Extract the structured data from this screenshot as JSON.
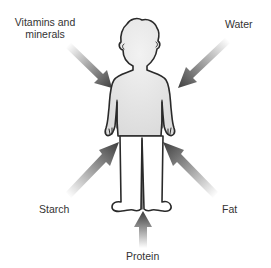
{
  "diagram": {
    "type": "nutrient-intake-figure",
    "central_figure": "human-body",
    "colors": {
      "outline": "#2a2a2a",
      "body_fill": "#e6e6e6",
      "arrow_dark": "#4a4a4a",
      "arrow_light": "#ffffff",
      "label_text": "#333333"
    },
    "labels": {
      "vitamins_line1": "Vitamins and",
      "vitamins_line2": "minerals",
      "water": "Water",
      "starch": "Starch",
      "fat": "Fat",
      "protein": "Protein"
    },
    "arrows": [
      {
        "name": "vitamins-and-minerals",
        "direction": "down-right"
      },
      {
        "name": "water",
        "direction": "down-left"
      },
      {
        "name": "starch",
        "direction": "up-right"
      },
      {
        "name": "fat",
        "direction": "up-left"
      },
      {
        "name": "protein",
        "direction": "up"
      }
    ]
  }
}
